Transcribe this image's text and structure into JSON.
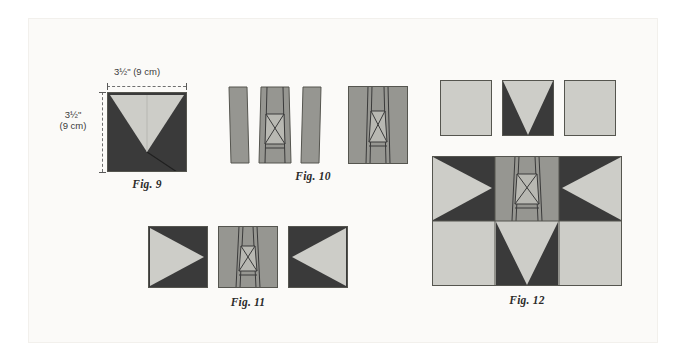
{
  "page": {
    "background_color": "#ffffff",
    "panel_color": "#fbfaf8"
  },
  "palette": {
    "dark_fabric": "#3a3a3a",
    "light_fabric": "#cdcdc8",
    "medium_fabric": "#969691",
    "outline": "#55554f",
    "seam_line": "#3a3a3a",
    "dimension_line": "#6f6f6f",
    "text": "#2b2b2b"
  },
  "dimensions": {
    "width_label": "3½\" (9 cm)",
    "height_label_line1": "3½\"",
    "height_label_line2": "(9 cm)"
  },
  "figures": [
    {
      "id": "fig-9",
      "caption": "Fig. 9",
      "description": "Square with light gray V-shaped triangle on dark gray background, showing diagonal seam line",
      "units": 1
    },
    {
      "id": "fig-10",
      "caption": "Fig. 10",
      "description": "Three medium gray strips with center hourglass X unit, then assembled into a single square",
      "units": 4
    },
    {
      "id": "fig-11",
      "caption": "Fig. 11",
      "description": "Light triangle pointing right, center hourglass X unit, light triangle pointing left",
      "units": 3
    },
    {
      "id": "fig-12",
      "caption": "Fig. 12",
      "description": "Three squares above (plain light, dark V, plain light) and the assembled 3x2 block below",
      "units": 4
    }
  ],
  "labels": {
    "fig9": "Fig. 9",
    "fig10": "Fig. 10",
    "fig11": "Fig. 11",
    "fig12": "Fig. 12"
  }
}
